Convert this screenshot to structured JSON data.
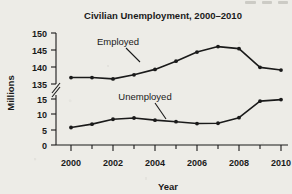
{
  "chart_data": {
    "type": "line",
    "title": "Civilian Unemployment, 2000–2010",
    "xlabel": "Year",
    "ylabel": "Millions",
    "x": [
      2000,
      2001,
      2002,
      2003,
      2004,
      2005,
      2006,
      2007,
      2008,
      2009,
      2010
    ],
    "xtick_labels": [
      "2000",
      "2002",
      "2004",
      "2006",
      "2008",
      "2010"
    ],
    "xticks_major": [
      2000,
      2002,
      2004,
      2006,
      2008,
      2010
    ],
    "xticks_minor": [
      2001,
      2003,
      2005,
      2007,
      2009
    ],
    "xlim": [
      1999.5,
      2010.6
    ],
    "ytick_labels_upper": [
      "150",
      "145",
      "140",
      "135"
    ],
    "ytick_labels_lower": [
      "15",
      "10",
      "5",
      "0"
    ],
    "yticks_upper": [
      150,
      145,
      140,
      135
    ],
    "yticks_lower": [
      15,
      10,
      5,
      0
    ],
    "ylim_upper": [
      134,
      150
    ],
    "ylim_lower": [
      0,
      16
    ],
    "axis_break": true,
    "axis_break_symbol": "double-slash",
    "grid": false,
    "legend_position": "inline-annotation",
    "series": [
      {
        "name": "Employed",
        "label_text": "Employed",
        "values": [
          136.9,
          136.9,
          136.5,
          137.7,
          139.3,
          141.7,
          144.4,
          146.0,
          145.4,
          139.9,
          139.1
        ],
        "marker": "filled-circle",
        "color": "#1a1a1a"
      },
      {
        "name": "Unemployed",
        "label_text": "Unemployed",
        "values": [
          5.7,
          6.8,
          8.4,
          8.8,
          8.1,
          7.6,
          7.0,
          7.1,
          8.9,
          14.3,
          14.8
        ],
        "marker": "filled-circle",
        "color": "#1a1a1a"
      }
    ],
    "annotations": [
      {
        "text": "Employed",
        "points_to_year": 2004,
        "points_to_series": "Employed"
      },
      {
        "text": "Unemployed",
        "points_to_year": 2005,
        "points_to_series": "Unemployed"
      }
    ]
  },
  "colors": {
    "background": "#edece7",
    "ink": "#1a1a1a",
    "axis": "#1a1a1a"
  }
}
